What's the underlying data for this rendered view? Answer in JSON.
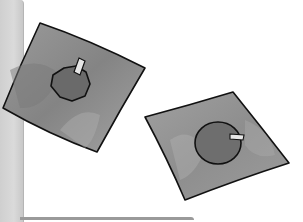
{
  "image": {
    "description": "Hand-drawn illustration of two tilted gray squares, each containing a darker fruit-like shape with a small stem/tab",
    "colors": {
      "background": "#ffffff",
      "panel": "#d4d4d4",
      "square_fill": "#8f8f8f",
      "square_fill_light": "#a6a6a6",
      "shape_fill": "#6b6b6b",
      "outline": "#111111",
      "tab_fill": "#e8e8e8"
    },
    "objects": [
      {
        "name": "left-square",
        "shape_inside": "octagon-apple-with-stem"
      },
      {
        "name": "right-square",
        "shape_inside": "circle-with-tab"
      }
    ]
  }
}
